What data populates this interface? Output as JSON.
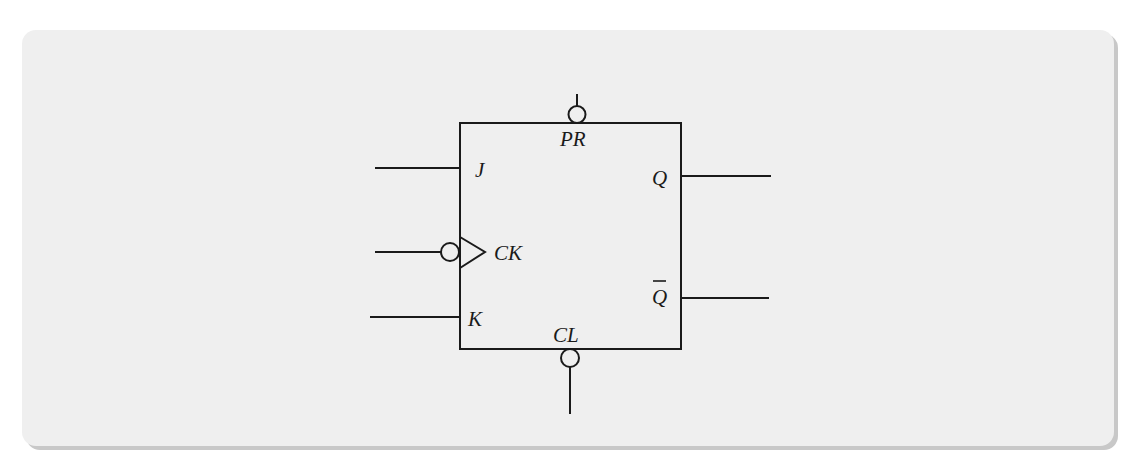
{
  "diagram": {
    "type": "JK flip-flop logic symbol",
    "colors": {
      "panel": "#efefef",
      "shadow": "#c8c8c8",
      "stroke": "#1a1a1a"
    },
    "block": {
      "x": 460,
      "y": 123,
      "width": 221,
      "height": 226
    },
    "labels": {
      "preset": "PR",
      "j": "J",
      "clock": "CK",
      "k": "K",
      "clear": "CL",
      "q": "Q",
      "q_bar": "Q"
    },
    "pins": {
      "preset": {
        "side": "top",
        "active_low": true
      },
      "j": {
        "side": "left",
        "active_low": false
      },
      "clock": {
        "side": "left",
        "active_low": true,
        "edge_triggered": true
      },
      "k": {
        "side": "left",
        "active_low": false
      },
      "clear": {
        "side": "bottom",
        "active_low": true
      },
      "q": {
        "side": "right",
        "active_low": false
      },
      "q_bar": {
        "side": "right",
        "complement": true
      }
    }
  }
}
